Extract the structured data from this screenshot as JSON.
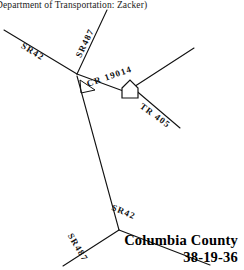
{
  "document": {
    "header_caption": "Department of Transportation:  Zacker)",
    "type": "road-sketch-map"
  },
  "corner_block": {
    "county": "Columbia County",
    "code": "38-19-36"
  },
  "colors": {
    "ink": "#111111",
    "paper": "#ffffff",
    "caption_ink": "#1b1b1b"
  },
  "map": {
    "structure_icon": "house-icon",
    "junction_marker": "angle-arc-marker",
    "roads": [
      {
        "id": "sr42-upper",
        "label": "SR42",
        "path": "M 4 30 L 77 74",
        "label_x": 22,
        "label_y": 40,
        "label_rotate": 31
      },
      {
        "id": "sr487-upper",
        "label": "SR487",
        "path": "M 107 10 L 77 74",
        "label_x": 78,
        "label_y": 52,
        "label_rotate": -64
      },
      {
        "id": "cr19014",
        "label": "CR 19014",
        "path": "M 77 74 L 126 92 L 194 48",
        "label_x": 87,
        "label_y": 79,
        "label_rotate": -19
      },
      {
        "id": "tr405",
        "label": "TR 405",
        "path": "M 133 88 L 180 128",
        "label_x": 141,
        "label_y": 100,
        "label_rotate": 36
      },
      {
        "id": "connector-north-south",
        "label": "",
        "path": "M 77 76 L 119 230",
        "label_x": 0,
        "label_y": 0,
        "label_rotate": 0
      },
      {
        "id": "sr487-lower",
        "label": "SR487",
        "path": "M 119 230 L 63 266",
        "label_x": 70,
        "label_y": 229,
        "label_rotate": 59
      },
      {
        "id": "sr42-lower",
        "label": "SR42",
        "path": "M 119 230 L 210 265",
        "label_x": 112,
        "label_y": 202,
        "label_rotate": 22
      }
    ]
  }
}
